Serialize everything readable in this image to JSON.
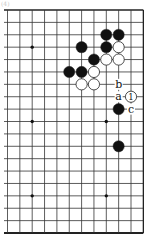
{
  "caption": "(4)",
  "board": {
    "grid": {
      "cols": 12,
      "rows": 19,
      "x0": 7.5,
      "y0": 10,
      "dx": 12.35,
      "dy": 12.39,
      "line_left_extend": 4,
      "top_edge": true,
      "right_edge": true,
      "bottom_edge_thick": true,
      "line_color": "#333333",
      "edge_color": "#222222"
    },
    "star_points": [
      {
        "col": 2,
        "row": 3
      },
      {
        "col": 8,
        "row": 3
      },
      {
        "col": 2,
        "row": 9
      },
      {
        "col": 8,
        "row": 9
      },
      {
        "col": 2,
        "row": 15
      },
      {
        "col": 8,
        "row": 15
      }
    ],
    "stones": [
      {
        "col": 8,
        "row": 2,
        "color": "black"
      },
      {
        "col": 9,
        "row": 2,
        "color": "black"
      },
      {
        "col": 6,
        "row": 3,
        "color": "black"
      },
      {
        "col": 8,
        "row": 3,
        "color": "black"
      },
      {
        "col": 9,
        "row": 3,
        "color": "white"
      },
      {
        "col": 7,
        "row": 4,
        "color": "black"
      },
      {
        "col": 8,
        "row": 4,
        "color": "white"
      },
      {
        "col": 9,
        "row": 4,
        "color": "white"
      },
      {
        "col": 5,
        "row": 5,
        "color": "black"
      },
      {
        "col": 6,
        "row": 5,
        "color": "black"
      },
      {
        "col": 7,
        "row": 5,
        "color": "white"
      },
      {
        "col": 6,
        "row": 6,
        "color": "white"
      },
      {
        "col": 7,
        "row": 6,
        "color": "white"
      },
      {
        "col": 10,
        "row": 7,
        "color": "white",
        "number": "1"
      },
      {
        "col": 9,
        "row": 8,
        "color": "black"
      },
      {
        "col": 9,
        "row": 11,
        "color": "black"
      }
    ],
    "labels": [
      {
        "col": 9,
        "row": 6,
        "text": "b"
      },
      {
        "col": 9,
        "row": 7,
        "text": "a"
      },
      {
        "col": 10,
        "row": 8,
        "text": "c"
      }
    ],
    "colors": {
      "black_stone": "#111111",
      "white_stone": "#ffffff",
      "stone_outline": "#222222",
      "background": "#ffffff"
    }
  }
}
